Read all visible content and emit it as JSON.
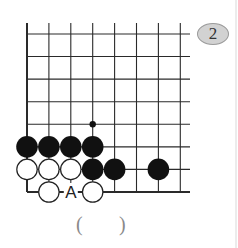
{
  "problem": {
    "number": "2",
    "answer_open": "(",
    "answer_close": ")"
  },
  "board": {
    "columns": 8,
    "rows": 8,
    "origin_x": 27,
    "origin_y": 34,
    "spacing_x": 21.9,
    "spacing_y": 22.57,
    "line_top_y": 23,
    "line_right_x": 190,
    "stone_radius": 10.8,
    "edges": [
      "left",
      "bottom"
    ],
    "colors": {
      "line": "#2a2a2a",
      "black_stone": "#111111",
      "white_stone_fill": "#ffffff",
      "white_stone_stroke": "#222222",
      "badge_fill": "#d2d2d2"
    },
    "black_stones": [
      {
        "col": 0,
        "row": 5
      },
      {
        "col": 1,
        "row": 5
      },
      {
        "col": 2,
        "row": 5
      },
      {
        "col": 3,
        "row": 5
      },
      {
        "col": 3,
        "row": 6
      },
      {
        "col": 4,
        "row": 6
      },
      {
        "col": 6,
        "row": 6
      }
    ],
    "white_stones": [
      {
        "col": 0,
        "row": 6
      },
      {
        "col": 1,
        "row": 6
      },
      {
        "col": 2,
        "row": 6
      },
      {
        "col": 1,
        "row": 7
      },
      {
        "col": 3,
        "row": 7
      }
    ],
    "markers": [
      {
        "type": "dot",
        "col": 3,
        "row": 4
      }
    ],
    "labels": [
      {
        "text": "A",
        "col": 2,
        "row": 7
      }
    ]
  }
}
